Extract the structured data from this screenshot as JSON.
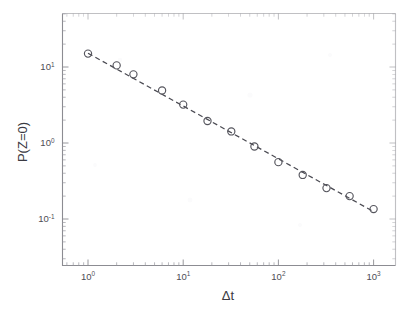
{
  "figure": {
    "background_color": "#ffffff",
    "frame_color": "#8c8c92",
    "marker_color": "#55555d",
    "fit_line_color": "#4a4a52"
  },
  "axes": {
    "x_title": "Δt",
    "y_title": "P(Z=0)",
    "x_tick_labels": [
      {
        "base": "10",
        "exp": "0"
      },
      {
        "base": "10",
        "exp": "1"
      },
      {
        "base": "10",
        "exp": "2"
      },
      {
        "base": "10",
        "exp": "3"
      }
    ],
    "y_tick_labels": [
      {
        "base": "10",
        "exp": "1"
      },
      {
        "base": "10",
        "exp": "0"
      },
      {
        "base": "10",
        "exp": "-1"
      }
    ]
  },
  "chart_data": {
    "type": "scatter",
    "title": "",
    "subtitle": "",
    "xlabel": "Δt",
    "ylabel": "P(Z=0)",
    "xscale": "log",
    "yscale": "log",
    "xlim": [
      0.55,
      2200
    ],
    "ylim": [
      0.032,
      42
    ],
    "grid": false,
    "legend": null,
    "marker_style": "open-circle",
    "series": [
      {
        "name": "P(Z=0) data",
        "x": [
          1,
          2,
          3,
          6,
          10,
          18,
          32,
          56,
          100,
          180,
          320,
          560,
          1000
        ],
        "y": [
          15.0,
          10.5,
          8.0,
          4.9,
          3.2,
          1.95,
          1.42,
          0.9,
          0.56,
          0.38,
          0.255,
          0.2,
          0.135
        ]
      },
      {
        "name": "power-law fit",
        "type": "line",
        "style": "dashed",
        "x": [
          1,
          1000
        ],
        "y": [
          15.2,
          0.125
        ],
        "slope": -0.695
      }
    ]
  }
}
